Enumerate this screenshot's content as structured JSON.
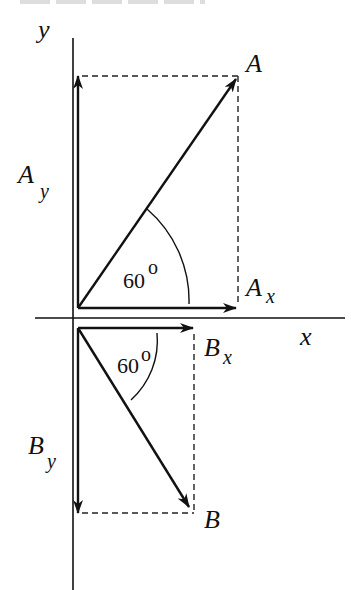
{
  "figure": {
    "type": "vector-components-diagram",
    "axes": {
      "x_label": "x",
      "y_label": "y",
      "origin": [
        73,
        318
      ],
      "x_axis": {
        "from": [
          35,
          318
        ],
        "to": [
          345,
          318
        ]
      },
      "y_axis": {
        "from": [
          73,
          38
        ],
        "to": [
          73,
          590
        ]
      }
    },
    "vectors": [
      {
        "id": "A",
        "label": "A",
        "from": [
          78,
          308
        ],
        "to": [
          236,
          79
        ],
        "angle_label": "60",
        "angle_unit": "o",
        "components": {
          "x": {
            "label_main": "A",
            "label_sub": "x",
            "from": [
              78,
              308
            ],
            "to": [
              236,
              308
            ]
          },
          "y": {
            "label_main": "A",
            "label_sub": "y",
            "from": [
              78,
              308
            ],
            "to": [
              78,
              76
            ]
          }
        }
      },
      {
        "id": "B",
        "label": "B",
        "from": [
          78,
          328
        ],
        "to": [
          189,
          507
        ],
        "angle_label": "60",
        "angle_unit": "o",
        "components": {
          "x": {
            "label_main": "B",
            "label_sub": "x",
            "from": [
              78,
              328
            ],
            "to": [
              193,
              328
            ]
          },
          "y": {
            "label_main": "B",
            "label_sub": "y",
            "from": [
              78,
              328
            ],
            "to": [
              78,
              513
            ]
          }
        }
      }
    ],
    "colors": {
      "ink": "#111111",
      "background": "#ffffff"
    }
  }
}
